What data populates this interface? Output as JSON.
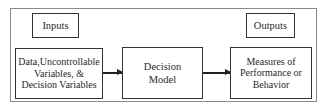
{
  "diagram": {
    "labels": {
      "inputs": "Inputs",
      "outputs": "Outputs"
    },
    "nodes": [
      {
        "id": "data",
        "lines": [
          "Data,Uncontrollable",
          "Variables, &",
          "Decision Variables"
        ]
      },
      {
        "id": "model",
        "lines": [
          "Decision",
          "Model"
        ]
      },
      {
        "id": "measures",
        "lines": [
          "Measures of",
          "Performance or",
          "Behavior"
        ]
      }
    ],
    "edges": [
      {
        "from": "data",
        "to": "model"
      },
      {
        "from": "model",
        "to": "measures"
      }
    ]
  }
}
